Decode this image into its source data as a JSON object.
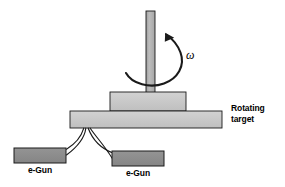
{
  "figure": {
    "kind": "schematic-diagram",
    "background_color": "#ffffff",
    "line_color": "#1a1a1a",
    "canvas": {
      "width": 285,
      "height": 187
    }
  },
  "labels": {
    "rotating_target": "Rotating\ntarget",
    "egun_left": "e-Gun",
    "egun_right": "e-Gun",
    "angular_velocity": "ω"
  },
  "parts": {
    "shaft": {
      "name": "drive-shaft",
      "fill": "#b3b3b3",
      "stroke": "#1a1a1a",
      "x": 146,
      "y": 11,
      "width": 9,
      "height": 81
    },
    "hub": {
      "name": "target-hub-block",
      "fill": "#c9c9c9",
      "stroke": "#1a1a1a",
      "x": 110,
      "y": 92,
      "width": 76,
      "height": 19
    },
    "target_plate": {
      "name": "rotating-target-plate",
      "fill": "#c9c9c9",
      "stroke": "#1a1a1a",
      "x": 70,
      "y": 111,
      "width": 152,
      "height": 17
    },
    "egun_left_box": {
      "name": "egun-left-body",
      "fill": "#8c8c8c",
      "stroke": "#1a1a1a",
      "x": 14,
      "y": 148,
      "width": 52,
      "height": 15
    },
    "egun_right_box": {
      "name": "egun-right-body",
      "fill": "#8c8c8c",
      "stroke": "#1a1a1a",
      "x": 112,
      "y": 151,
      "width": 52,
      "height": 15
    }
  },
  "beams": {
    "convergence_point": {
      "x": 86,
      "y": 128
    },
    "count": 4,
    "stroke": "#1a1a1a",
    "stroke_width": 1.1,
    "paths": [
      "M 83.5 128.5 C 81 137 74 144 66 149.5",
      "M 85.5 128.5 C 84 139 76 147 66 154.5",
      "M 88 128.5 C 92 139 101 148 112 153",
      "M 90 128.5 C 96 137 104 145 112 158"
    ]
  },
  "rotation_arrow": {
    "name": "rotation-direction-arrow",
    "path": "M 126 73 C 132 84 150 88 164 83 C 178 78 185 66 180 52 C 177 44 171 38 165 34",
    "stroke": "#1a1a1a",
    "stroke_width": 2.0,
    "arrowhead": "M 165 34 L 173 37.5 L 165.5 41.5 Z"
  }
}
